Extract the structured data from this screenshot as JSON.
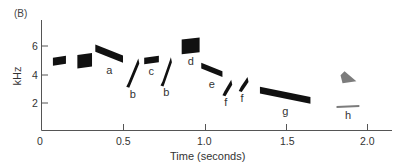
{
  "chart_data": {
    "type": "spectrogram",
    "panel_label": "(B)",
    "title": "",
    "xlabel": "Time (seconds)",
    "ylabel": "kHz",
    "xlim": [
      0,
      2.1
    ],
    "ylim": [
      0,
      7.5
    ],
    "xticks": [
      "0",
      "0.5",
      "1.0",
      "1.5",
      "2.0"
    ],
    "yticks": [
      "2",
      "4",
      "6"
    ],
    "grid": false,
    "syllables": [
      {
        "label": "",
        "t_start": 0.07,
        "t_end": 0.15,
        "f_low": 4.6,
        "f_high": 5.3
      },
      {
        "label": "",
        "t_start": 0.22,
        "t_end": 0.31,
        "f_low": 4.4,
        "f_high": 5.5
      },
      {
        "label": "a",
        "t_start": 0.33,
        "t_end": 0.5,
        "f_low": 4.8,
        "f_high": 6.1
      },
      {
        "label": "b",
        "t_start": 0.52,
        "t_end": 0.6,
        "f_low": 3.1,
        "f_high": 5.1
      },
      {
        "label": "c",
        "t_start": 0.63,
        "t_end": 0.72,
        "f_low": 4.7,
        "f_high": 5.3
      },
      {
        "label": "b",
        "t_start": 0.73,
        "t_end": 0.8,
        "f_low": 3.2,
        "f_high": 5.2
      },
      {
        "label": "d",
        "t_start": 0.86,
        "t_end": 0.97,
        "f_low": 5.4,
        "f_high": 6.6
      },
      {
        "label": "e",
        "t_start": 0.98,
        "t_end": 1.11,
        "f_low": 3.8,
        "f_high": 4.8
      },
      {
        "label": "f",
        "t_start": 1.11,
        "t_end": 1.17,
        "f_low": 2.5,
        "f_high": 3.6
      },
      {
        "label": "f",
        "t_start": 1.21,
        "t_end": 1.27,
        "f_low": 2.8,
        "f_high": 3.8
      },
      {
        "label": "g",
        "t_start": 1.34,
        "t_end": 1.65,
        "f_low": 1.9,
        "f_high": 3.1
      },
      {
        "label": "h",
        "t_start": 1.81,
        "t_end": 1.95,
        "f_low": 1.6,
        "f_high": 4.2
      }
    ]
  }
}
